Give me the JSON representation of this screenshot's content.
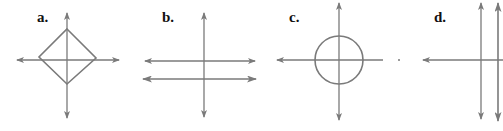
{
  "figure": {
    "panels": [
      {
        "id": "a",
        "label": "a.",
        "shape": "diamond-on-axes",
        "description": "Square rotated 45° (diamond) centered at origin of x-y axes"
      },
      {
        "id": "b",
        "label": "b.",
        "shape": "two-horizontal-lines",
        "description": "Two parallel horizontal lines with a vertical axis"
      },
      {
        "id": "c",
        "label": "c.",
        "shape": "circle-on-axes",
        "description": "Circle centered at origin of x-y axes"
      },
      {
        "id": "d",
        "label": "d.",
        "shape": "two-vertical-lines",
        "description": "Two parallel vertical lines with a horizontal axis"
      }
    ],
    "colors": {
      "line": "#7a7a7a",
      "label": "#111111",
      "background": "#ffffff"
    }
  }
}
